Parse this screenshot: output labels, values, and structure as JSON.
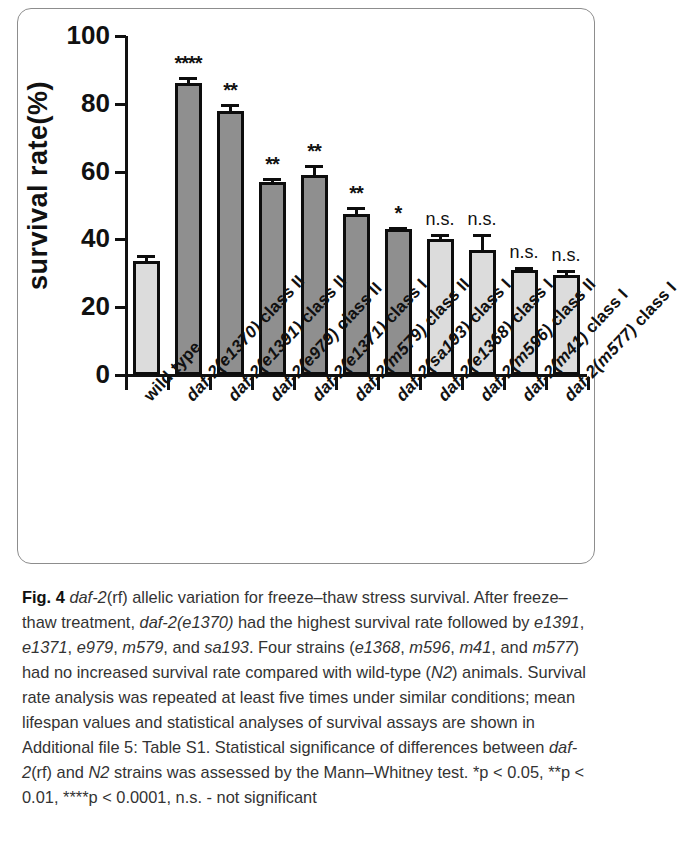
{
  "figure": {
    "label": "Fig. 4",
    "ylabel": "survival rate(%)"
  },
  "chart_data": {
    "type": "bar",
    "title": "",
    "xlabel": "",
    "ylabel": "survival rate(%)",
    "ylim": [
      0,
      100
    ],
    "yticks": [
      0,
      20,
      40,
      60,
      80,
      100
    ],
    "grid": false,
    "legend": "none",
    "categories": [
      "wild type",
      "daf-2(e1370) class II",
      "daf-2(e1391) class II",
      "daf-2(e979) class II",
      "daf-2(e1371) class I",
      "daf-2(m579) class II",
      "daf-2(sa193) class I",
      "daf-2(e1368) class I",
      "daf-2(m596) class II",
      "daf-2(m41) class I",
      "daf-2(m577) class I"
    ],
    "values": [
      33.5,
      86.0,
      78.0,
      57.0,
      59.0,
      47.5,
      43.0,
      40.0,
      37.0,
      31.0,
      29.5
    ],
    "errors": [
      2.0,
      2.0,
      2.0,
      1.2,
      3.0,
      2.0,
      0.8,
      1.5,
      4.5,
      1.0,
      1.5
    ],
    "significance": [
      "",
      "****",
      "**",
      "**",
      "**",
      "**",
      "*",
      "n.s.",
      "n.s.",
      "n.s.",
      "n.s."
    ],
    "bar_shades": [
      "light",
      "dark",
      "dark",
      "dark",
      "dark",
      "dark",
      "dark",
      "light",
      "light",
      "light",
      "light"
    ],
    "colors": {
      "dark_bar": "#8f8f8f",
      "light_bar": "#dcdcdc",
      "outline": "#0d0d0d",
      "axis": "#111111"
    }
  },
  "xlabels": [
    {
      "prefix": "",
      "italic": "",
      "suffix": "wild type"
    },
    {
      "prefix": "daf-2(e1370)",
      "italic": "daf-2(e1370)",
      "suffix": " class II"
    },
    {
      "prefix": "daf-2(e1391)",
      "italic": "daf-2(e1391)",
      "suffix": " class II"
    },
    {
      "prefix": "daf-2(e979)",
      "italic": "daf-2(e979)",
      "suffix": " class II"
    },
    {
      "prefix": "daf-2(e1371)",
      "italic": "daf-2(e1371)",
      "suffix": " class I"
    },
    {
      "prefix": "daf-2(m579)",
      "italic": "daf-2(m579)",
      "suffix": " class II"
    },
    {
      "prefix": "daf-2(sa193)",
      "italic": "daf-2(sa193)",
      "suffix": " class I"
    },
    {
      "prefix": "daf-2(e1368)",
      "italic": "daf-2(e1368)",
      "suffix": " class I"
    },
    {
      "prefix": "daf-2(m596)",
      "italic": "daf-2(m596)",
      "suffix": " class II"
    },
    {
      "prefix": "daf-2(m41)",
      "italic": "daf-2(m41)",
      "suffix": " class I"
    },
    {
      "prefix": "daf-2(m577)",
      "italic": "daf-2(m577)",
      "suffix": " class I"
    }
  ],
  "caption": {
    "fig_number": "Fig. 4",
    "text_parts": [
      {
        "t": "Fig. 4",
        "s": "bold"
      },
      {
        "t": " ",
        "s": "plain"
      },
      {
        "t": "daf-2",
        "s": "italic"
      },
      {
        "t": "(rf) allelic variation for freeze–thaw stress survival. After freeze–thaw treatment, ",
        "s": "plain"
      },
      {
        "t": "daf-2(e1370)",
        "s": "italic"
      },
      {
        "t": " had the highest survival rate followed by ",
        "s": "plain"
      },
      {
        "t": "e1391",
        "s": "italic"
      },
      {
        "t": ", ",
        "s": "plain"
      },
      {
        "t": "e1371",
        "s": "italic"
      },
      {
        "t": ", ",
        "s": "plain"
      },
      {
        "t": "e979",
        "s": "italic"
      },
      {
        "t": ", ",
        "s": "plain"
      },
      {
        "t": "m579",
        "s": "italic"
      },
      {
        "t": ", and ",
        "s": "plain"
      },
      {
        "t": "sa193",
        "s": "italic"
      },
      {
        "t": ". Four strains (",
        "s": "plain"
      },
      {
        "t": "e1368",
        "s": "italic"
      },
      {
        "t": ", ",
        "s": "plain"
      },
      {
        "t": "m596",
        "s": "italic"
      },
      {
        "t": ", ",
        "s": "plain"
      },
      {
        "t": "m41",
        "s": "italic"
      },
      {
        "t": ", and ",
        "s": "plain"
      },
      {
        "t": "m577",
        "s": "italic"
      },
      {
        "t": ") had no increased survival rate compared with wild-type (",
        "s": "plain"
      },
      {
        "t": "N2",
        "s": "italic"
      },
      {
        "t": ") animals. Survival rate analysis was repeated at least five times under similar conditions; mean lifespan values and statistical analyses of survival assays are shown in Additional file 5: Table S1. Statistical significance of differences between ",
        "s": "plain"
      },
      {
        "t": "daf-2",
        "s": "italic"
      },
      {
        "t": "(rf) and ",
        "s": "plain"
      },
      {
        "t": "N2",
        "s": "italic"
      },
      {
        "t": " strains was assessed by the Mann–Whitney test. *p < 0.05, **p < 0.01, ****p < 0.0001, n.s. - not significant",
        "s": "plain"
      }
    ]
  }
}
